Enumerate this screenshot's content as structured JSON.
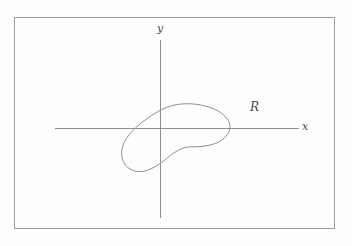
{
  "figure": {
    "background": "#fdfdfd",
    "frame_color": "#9b9b9b",
    "line_color": "#8f8f8f",
    "label_color": "#4d4d4d",
    "labels": {
      "y_axis": "y",
      "x_axis": "x",
      "region": "R"
    },
    "axes": {
      "x_axis": {
        "x1": "55",
        "y1": "128.5",
        "x2": "299",
        "y2": "128.5"
      },
      "y_axis": {
        "x1": "160.5",
        "y1": "40",
        "x2": "160.5",
        "y2": "218"
      }
    },
    "region_curve_path": "M 181,104 C 194,102.8 208,105.5 218,111 C 225.5,115.5 230,121 230,126.5 C 230,133 224.5,140 215.5,143.5 C 207,146.5 197,147.2 189.5,146.8 C 180.5,147.5 172.5,153.5 165,159.8 C 156,167 148,171.2 140.5,171.6 C 131.5,172 124.5,166.5 122.3,158.8 C 120.6,152 122.2,145 126.2,138.8 C 131,131.5 138.5,124.5 147.5,118.3 C 157.5,111.2 167.5,105.3 181,104 Z"
  }
}
